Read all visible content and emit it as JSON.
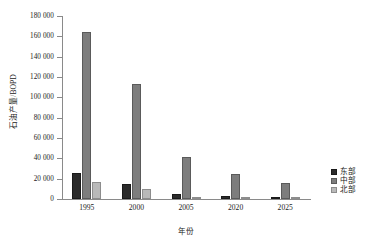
{
  "chart_data": {
    "type": "bar",
    "title": "",
    "xlabel": "年份",
    "ylabel": "石油产量/BOPD",
    "categories": [
      "1995",
      "2000",
      "2005",
      "2020",
      "2025"
    ],
    "series": [
      {
        "name": "东部",
        "color": "#2b2b2b",
        "values": [
          26000,
          15000,
          5000,
          2500,
          2000
        ]
      },
      {
        "name": "中部",
        "color": "#7d7d7d",
        "values": [
          164000,
          113000,
          41000,
          25000,
          16000
        ]
      },
      {
        "name": "北部",
        "color": "#b9b9b9",
        "values": [
          17000,
          9500,
          1000,
          1500,
          1000
        ]
      }
    ],
    "ylim": [
      0,
      180000
    ],
    "ytick_values": [
      0,
      20000,
      40000,
      60000,
      80000,
      100000,
      120000,
      140000,
      160000,
      180000
    ],
    "ytick_labels": [
      "0",
      "20 000",
      "40 000",
      "60 000",
      "80 000",
      "100 000",
      "120 000",
      "140 000",
      "160 000",
      "180 000"
    ],
    "grid": false,
    "legend_position": "right"
  }
}
